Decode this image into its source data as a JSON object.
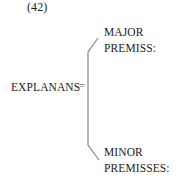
{
  "diagram": {
    "label": "(42)",
    "left_term": "EXPLANANS",
    "equals": "=",
    "branches": [
      {
        "line1": "MAJOR",
        "line2": "PREMISS:"
      },
      {
        "line1": "MINOR",
        "line2": "PREMISSES:"
      }
    ],
    "line_color": "#888888"
  }
}
